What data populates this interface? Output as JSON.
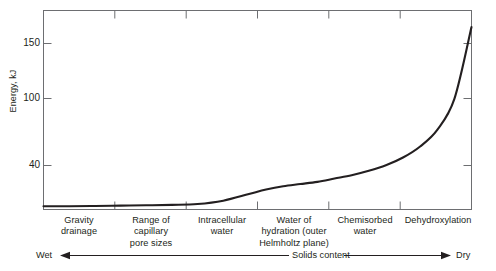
{
  "chart_data": {
    "type": "line",
    "title": "",
    "xlabel": "Solids content",
    "ylabel": "Energy, kJ",
    "ylim": [
      0,
      180
    ],
    "yticks": [
      40,
      100,
      150
    ],
    "ytick_labels": [
      "40",
      "100",
      "150"
    ],
    "grid": false,
    "legend": null,
    "x_axis_left_label": "Wet",
    "x_axis_right_label": "Dry",
    "x_axis_mid_label": "Solids content",
    "categories": [
      "Gravity drainage",
      "Range of capillary pore sizes",
      "Intracellular water",
      "Water of hydration (outer Helmholtz plane)",
      "Chemisorbed water",
      "Dehydroxylation"
    ],
    "zone_labels": [
      [
        "Gravity",
        "drainage"
      ],
      [
        "Range of",
        "capillary",
        "pore sizes"
      ],
      [
        "Intracellular",
        "water"
      ],
      [
        "Water of",
        "hydration (outer",
        "Helmholtz plane)"
      ],
      [
        "Chemisorbed",
        "water"
      ],
      [
        "Dehydroxylation"
      ]
    ],
    "series": [
      {
        "name": "Energy of water removal",
        "x": [
          0,
          6,
          12,
          18,
          24,
          30,
          36,
          42,
          48,
          52,
          56,
          60,
          64,
          68,
          72,
          76,
          80,
          84,
          88,
          92,
          96,
          100
        ],
        "values": [
          3,
          3,
          3.2,
          3.5,
          3.8,
          4.2,
          5,
          8,
          14,
          18,
          21,
          23,
          25,
          28,
          31,
          35,
          40,
          47,
          57,
          72,
          100,
          165
        ]
      }
    ]
  },
  "axis": {
    "y_title": "Energy, kJ",
    "y_tick_150": "150",
    "y_tick_100": "100",
    "y_tick_40": "40"
  },
  "zones": {
    "z0_l0": "Gravity",
    "z0_l1": "drainage",
    "z1_l0": "Range of",
    "z1_l1": "capillary",
    "z1_l2": "pore sizes",
    "z2_l0": "Intracellular",
    "z2_l1": "water",
    "z3_l0": "Water of",
    "z3_l1": "hydration (outer",
    "z3_l2": "Helmholtz plane)",
    "z4_l0": "Chemisorbed",
    "z4_l1": "water",
    "z5_l0": "Dehydroxylation"
  },
  "direction_bar": {
    "left": "Wet",
    "middle": "Solids content",
    "right": "Dry"
  },
  "colors": {
    "curve": "#231f20",
    "axis": "#6d6e71",
    "text": "#231f20",
    "background": "#ffffff"
  }
}
